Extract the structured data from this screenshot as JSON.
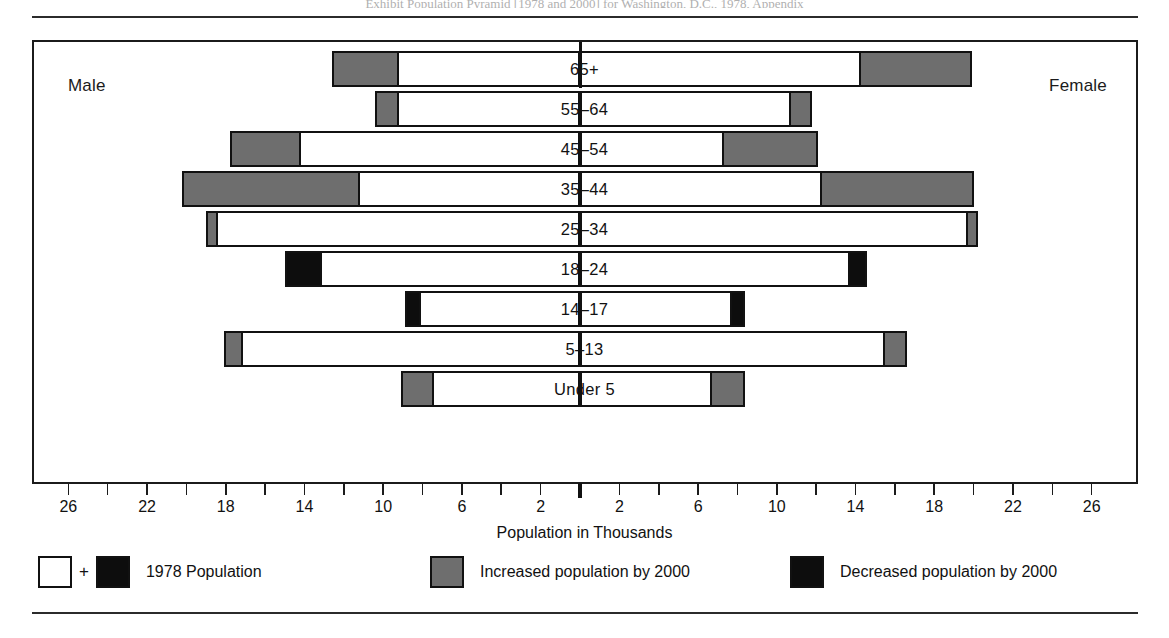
{
  "page": {
    "cut_caption": "Exhibit  Population  Pyramid  [1978 and 2000]  for  Washington,  D.C.,  1978,  Appendix"
  },
  "chart": {
    "male_label": "Male",
    "female_label": "Female",
    "axis_title": "Population in Thousands"
  },
  "legend": {
    "items": [
      {
        "name": "population-1978",
        "label": "1978 Population",
        "swatches": [
          "white",
          "black"
        ],
        "separator": "+"
      },
      {
        "name": "increase-2000",
        "label": "Increased population by 2000",
        "swatches": [
          "gray"
        ],
        "separator": ""
      },
      {
        "name": "decrease-2000",
        "label": "Decreased population by 2000",
        "swatches": [
          "black"
        ],
        "separator": ""
      }
    ]
  },
  "chart_data": {
    "type": "bar",
    "subtype": "population-pyramid",
    "title": "",
    "xlabel": "Population in Thousands",
    "ylabel": "",
    "grid": false,
    "legend_position": "bottom",
    "axis": {
      "center_value": 0,
      "max": 26,
      "tick_step": 2,
      "label_step": 4,
      "tick_values_left": [
        26,
        24,
        22,
        20,
        18,
        16,
        14,
        12,
        10,
        8,
        6,
        4,
        2
      ],
      "tick_values_right": [
        2,
        4,
        6,
        8,
        10,
        12,
        14,
        16,
        18,
        20,
        22,
        24,
        26
      ],
      "labeled_ticks_left": [
        26,
        22,
        18,
        14,
        10,
        6,
        2
      ],
      "labeled_ticks_right": [
        2,
        6,
        10,
        14,
        18,
        22,
        26
      ]
    },
    "categories": [
      "65+",
      "55-64",
      "45-54",
      "35-44",
      "25-34",
      "18-24",
      "14-17",
      "5-13",
      "Under 5"
    ],
    "series": [
      {
        "name": "Male 1978 Population",
        "side": "left",
        "units": "thousands",
        "values": [
          9.2,
          9.2,
          14.2,
          11.2,
          18.4,
          13.1,
          8.1,
          17.1,
          7.4
        ]
      },
      {
        "name": "Male 2000 Population",
        "side": "left",
        "units": "thousands",
        "values": [
          12.6,
          10.4,
          17.8,
          20.2,
          19.0,
          15.0,
          8.9,
          18.1,
          9.1
        ]
      },
      {
        "name": "Female 1978 Population",
        "side": "right",
        "units": "thousands",
        "values": [
          14.2,
          10.6,
          7.2,
          12.2,
          19.6,
          13.6,
          7.6,
          15.4,
          6.6
        ]
      },
      {
        "name": "Female 2000 Population",
        "side": "right",
        "units": "thousands",
        "values": [
          19.9,
          11.8,
          12.1,
          20.0,
          20.2,
          14.6,
          8.4,
          16.6,
          8.4
        ]
      }
    ],
    "rows": [
      {
        "category": "65+",
        "male": {
          "v1978": 9.2,
          "v2000": 12.6,
          "change": "increase"
        },
        "female": {
          "v1978": 14.2,
          "v2000": 19.9,
          "change": "increase"
        }
      },
      {
        "category": "55-64",
        "male": {
          "v1978": 9.2,
          "v2000": 10.4,
          "change": "increase"
        },
        "female": {
          "v1978": 10.6,
          "v2000": 11.8,
          "change": "increase"
        }
      },
      {
        "category": "45-54",
        "male": {
          "v1978": 14.2,
          "v2000": 17.8,
          "change": "increase"
        },
        "female": {
          "v1978": 7.2,
          "v2000": 12.1,
          "change": "increase"
        }
      },
      {
        "category": "35-44",
        "male": {
          "v1978": 11.2,
          "v2000": 20.2,
          "change": "increase"
        },
        "female": {
          "v1978": 12.2,
          "v2000": 20.0,
          "change": "increase"
        }
      },
      {
        "category": "25-34",
        "male": {
          "v1978": 18.4,
          "v2000": 19.0,
          "change": "increase"
        },
        "female": {
          "v1978": 19.6,
          "v2000": 20.2,
          "change": "increase"
        }
      },
      {
        "category": "18-24",
        "male": {
          "v1978": 13.1,
          "v2000": 15.0,
          "change": "decrease"
        },
        "female": {
          "v1978": 13.6,
          "v2000": 14.6,
          "change": "decrease"
        }
      },
      {
        "category": "14-17",
        "male": {
          "v1978": 8.1,
          "v2000": 8.9,
          "change": "decrease"
        },
        "female": {
          "v1978": 7.6,
          "v2000": 8.4,
          "change": "decrease"
        }
      },
      {
        "category": "5-13",
        "male": {
          "v1978": 17.1,
          "v2000": 18.1,
          "change": "increase"
        },
        "female": {
          "v1978": 15.4,
          "v2000": 16.6,
          "change": "increase"
        }
      },
      {
        "category": "Under 5",
        "male": {
          "v1978": 7.4,
          "v2000": 9.1,
          "change": "increase"
        },
        "female": {
          "v1978": 6.6,
          "v2000": 8.4,
          "change": "increase"
        }
      }
    ],
    "colors": {
      "base_1978": "#ffffff",
      "increase": "#6e6e6e",
      "decrease": "#0d0d0d",
      "outline": "#111111"
    }
  }
}
